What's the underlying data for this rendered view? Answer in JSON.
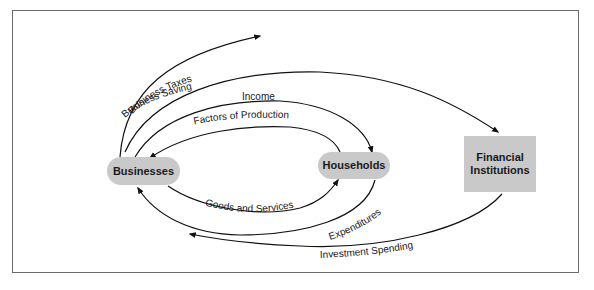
{
  "diagram": {
    "nodes": {
      "businesses": "Businesses",
      "households": "Households",
      "financial_institutions": "Financial Institutions"
    },
    "flows": {
      "business_taxes": "Business Taxes",
      "business_saving": "Business Saving",
      "income": "Income",
      "factors_of_production": "Factors of Production",
      "goods_and_services": "Goods and Services",
      "expenditures": "Expenditures",
      "investment_spending": "Investment Spending"
    },
    "colors": {
      "node_fill": "#c9c9c9",
      "line": "#111111",
      "border": "#6a6a6a"
    }
  }
}
